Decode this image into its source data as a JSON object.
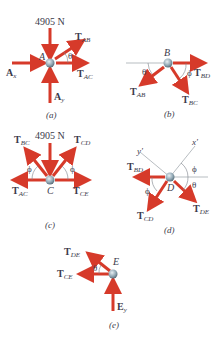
{
  "colors": {
    "force": "#d63a2a",
    "node": "#7f9aa8",
    "text": "#3a3a4a",
    "ref_line": "#9aa0a6"
  },
  "panels": {
    "a": {
      "caption": "(a)",
      "node": "A",
      "load": "4905 N",
      "forces": [
        {
          "main": "T",
          "sub": "AB"
        },
        {
          "main": "T",
          "sub": "AC"
        },
        {
          "main": "A",
          "sub": "x"
        },
        {
          "main": "A",
          "sub": "y"
        }
      ],
      "angle": "θ"
    },
    "b": {
      "caption": "(b)",
      "node": "B",
      "forces": [
        {
          "main": "T",
          "sub": "AB"
        },
        {
          "main": "T",
          "sub": "BC"
        },
        {
          "main": "T",
          "sub": "BD"
        }
      ],
      "angles": [
        "θ",
        "ϕ"
      ]
    },
    "c": {
      "caption": "(c)",
      "node": "C",
      "load": "4905 N",
      "forces": [
        {
          "main": "T",
          "sub": "BC"
        },
        {
          "main": "T",
          "sub": "CD"
        },
        {
          "main": "T",
          "sub": "AC"
        },
        {
          "main": "T",
          "sub": "CE"
        }
      ],
      "angles": [
        "ϕ",
        "ϕ"
      ]
    },
    "d": {
      "caption": "(d)",
      "node": "D",
      "axes": [
        "y'",
        "x'"
      ],
      "forces": [
        {
          "main": "T",
          "sub": "BD"
        },
        {
          "main": "T",
          "sub": "CD"
        },
        {
          "main": "T",
          "sub": "DE"
        }
      ],
      "angles": [
        "ϕ",
        "θ",
        "ϕ"
      ]
    },
    "e": {
      "caption": "(e)",
      "node": "E",
      "forces": [
        {
          "main": "T",
          "sub": "DE"
        },
        {
          "main": "T",
          "sub": "CE"
        },
        {
          "main": "E",
          "sub": "y"
        }
      ],
      "angle": "θ"
    }
  }
}
